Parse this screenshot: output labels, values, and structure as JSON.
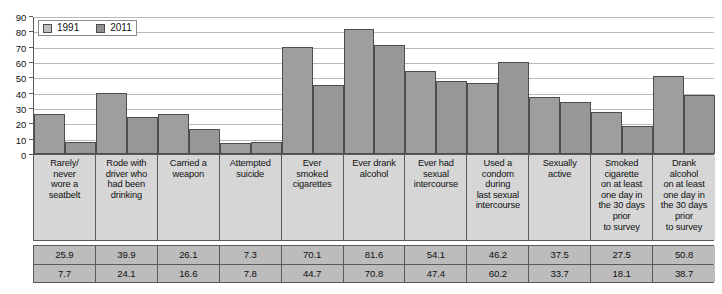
{
  "chart_data": {
    "type": "bar",
    "title": "",
    "xlabel": "",
    "ylabel": "",
    "ylim": [
      0,
      90
    ],
    "ytick_step": 10,
    "yticks": [
      0,
      10,
      20,
      30,
      40,
      50,
      60,
      70,
      80,
      90
    ],
    "grid": true,
    "legend_position": "top-left",
    "categories": [
      "Rarely/\nnever\nwore a\nseatbelt",
      "Rode with\ndriver who\nhad been\ndrinking",
      "Carried a\nweapon",
      "Attempted\nsuicide",
      "Ever\nsmoked\ncigarettes",
      "Ever drank\nalcohol",
      "Ever had\nsexual\nintercourse",
      "Used a\ncondom\nduring\nlast sexual\nintercourse",
      "Sexually\nactive",
      "Smoked\ncigarette\non at least\none day in\nthe 30 days\nprior\nto survey",
      "Drank\nalcohol\non at least\none day in\nthe 30 days\nprior\nto survey"
    ],
    "series": [
      {
        "name": "1991",
        "color": "#9e9e9e",
        "values": [
          25.9,
          39.9,
          26.1,
          7.3,
          70.1,
          81.6,
          54.1,
          46.2,
          37.5,
          27.5,
          50.8
        ]
      },
      {
        "name": "2011",
        "color": "#979797",
        "values": [
          7.7,
          24.1,
          16.6,
          7.8,
          44.7,
          70.8,
          47.4,
          60.2,
          33.7,
          18.1,
          38.7
        ]
      }
    ]
  },
  "legend": {
    "items": [
      {
        "label": "1991",
        "swatch_color": "#bfbfbf"
      },
      {
        "label": "2011",
        "swatch_color": "#8f8f8f"
      }
    ]
  },
  "colors": {
    "bar_1991": "#9e9e9e",
    "bar_2011": "#979797",
    "bar_outline": "#4d4d4d",
    "gridline": "#b9b9b9",
    "axis": "#5a5a5a",
    "label_cell_bg": "#d6d6d6",
    "data_cell_bg": "#bcbcbc"
  }
}
